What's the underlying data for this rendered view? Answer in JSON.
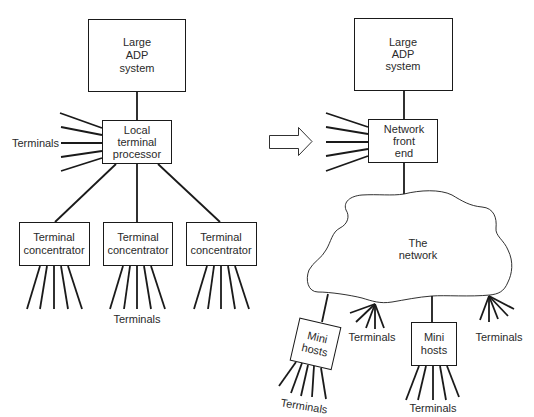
{
  "left": {
    "host": {
      "lines": [
        "Large",
        "ADP",
        "system"
      ]
    },
    "processor": {
      "lines": [
        "Local",
        "terminal",
        "processor"
      ]
    },
    "side_terminals_label": "Terminals",
    "concentrators": [
      {
        "lines": [
          "Terminal",
          "concentrator"
        ]
      },
      {
        "lines": [
          "Terminal",
          "concentrator"
        ]
      },
      {
        "lines": [
          "Terminal",
          "concentrator"
        ]
      }
    ],
    "bottom_terminals_label": "Terminals"
  },
  "arrow": {
    "icon": "right-arrow-outline-icon"
  },
  "right": {
    "host": {
      "lines": [
        "Large",
        "ADP",
        "system"
      ]
    },
    "front_end": {
      "lines": [
        "Network",
        "front",
        "end"
      ]
    },
    "network": {
      "lines": [
        "The",
        "network"
      ]
    },
    "mini_hosts": [
      {
        "lines": [
          "Mini",
          "hosts"
        ],
        "terminals_label": "Terminals"
      },
      {
        "lines": [
          "Mini",
          "hosts"
        ],
        "terminals_label": "Terminals"
      }
    ],
    "network_terminals": [
      {
        "label": "Terminals"
      },
      {
        "label": "Terminals"
      }
    ]
  },
  "colors": {
    "stroke": "#1a1a1a",
    "text": "#2a2a2a",
    "background": "#ffffff"
  }
}
